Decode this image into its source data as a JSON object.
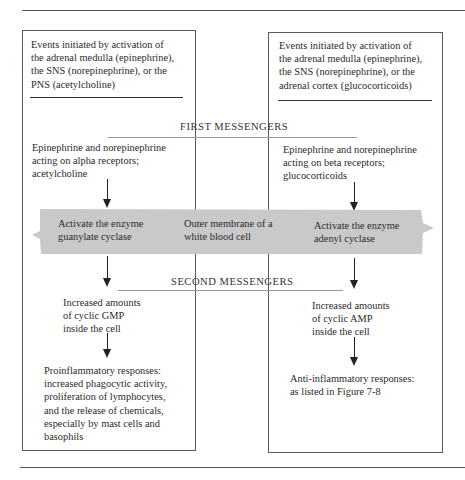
{
  "figure": {
    "left_column": {
      "header": "Events initiated by activation of\nthe adrenal medulla (epinephrine),\nthe SNS (norepinephrine), or the\nPNS (acetylcholine)",
      "first_messenger": "Epinephrine and norepinephrine\nacting on alpha receptors;\nacetylcholine",
      "enzyme": "Activate the enzyme\nguanylate cyclase",
      "second_messenger": "Increased amounts\nof cyclic GMP\ninside the cell",
      "response": "Proinflammatory responses:\nincreased phagocytic activity,\nproliferation of lymphocytes,\nand the release of chemicals,\nespecially by mast cells and\nbasophils"
    },
    "right_column": {
      "header": "Events initiated by activation of\nthe adrenal medulla (epinephrine),\nthe SNS (norepinephrine), or the\nadrenal cortex (glucocorticoids)",
      "first_messenger": "Epinephrine and norepinephrine\nacting on beta receptors;\nglucocorticoids",
      "enzyme": "Activate the enzyme\nadenyl cyclase",
      "second_messenger": "Increased amounts\nof cyclic AMP\ninside the cell",
      "response": "Anti-inflammatory responses:\nas listed in Figure 7-8"
    },
    "center": {
      "membrane_label": "Outer membrane of a\nwhite blood cell"
    },
    "headings": {
      "first_messengers": "FIRST MESSENGERS",
      "second_messengers": "SECOND MESSENGERS"
    },
    "colors": {
      "membrane_band": "#c9c9c9",
      "line": "#5a5a5a",
      "arrow": "#222222",
      "text": "#2b2b2b"
    }
  }
}
